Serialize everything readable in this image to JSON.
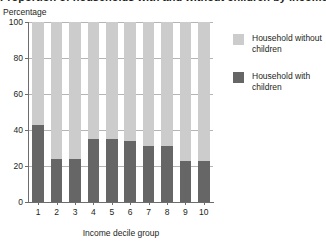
{
  "chart_data": {
    "type": "bar",
    "subtype": "stacked-percentage",
    "title": "Proportion of households with and without children by income decile group",
    "ylabel": "Percentage",
    "xlabel": "Income decile group",
    "categories": [
      "1",
      "2",
      "3",
      "4",
      "5",
      "6",
      "7",
      "8",
      "9",
      "10"
    ],
    "ylim": [
      0,
      100
    ],
    "yticks": [
      0,
      20,
      40,
      60,
      80,
      100
    ],
    "ytick_labels": [
      "0",
      "20",
      "40",
      "60",
      "80",
      "100"
    ],
    "grid": true,
    "grid_axis": "y",
    "legend_position": "right",
    "series": [
      {
        "name": "Household with children",
        "color": "#666666",
        "values": [
          43,
          24,
          24,
          35,
          35,
          34,
          31,
          31,
          23,
          23
        ]
      },
      {
        "name": "Household without children",
        "color": "#cccccc",
        "values": [
          57,
          76,
          76,
          65,
          65,
          66,
          69,
          69,
          77,
          77
        ]
      }
    ]
  },
  "legend": {
    "items": [
      {
        "label": "Household without children",
        "color": "#cccccc"
      },
      {
        "label": "Household with children",
        "color": "#666666"
      }
    ]
  },
  "colors": {
    "without_children": "#cccccc",
    "with_children": "#666666",
    "axis": "#6d6d6d",
    "gridline": "#b5b5b5",
    "text": "#231f20"
  }
}
